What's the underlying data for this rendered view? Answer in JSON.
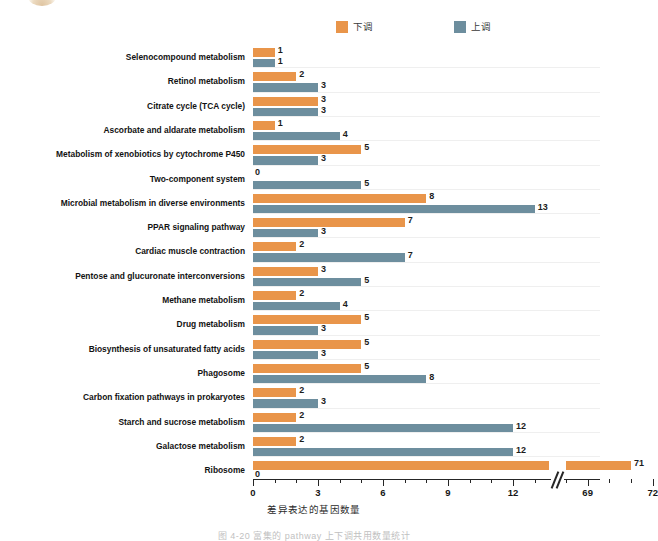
{
  "legend": {
    "entries": [
      {
        "label": "下调",
        "color": "#e9954a",
        "name": "down-regulated"
      },
      {
        "label": "上调",
        "color": "#6d8e9e",
        "name": "up-regulated"
      }
    ]
  },
  "axis": {
    "x_title": "差异表达的基因数量",
    "tick_labels": [
      "0",
      "3",
      "6",
      "9",
      "12",
      "69",
      "72"
    ],
    "has_break": true,
    "break_between": [
      12,
      69
    ]
  },
  "caption": {
    "text": "图 4-20  富集的 pathway 上下调共用数量统计"
  },
  "chart_data": {
    "type": "bar",
    "orientation": "horizontal",
    "title": "",
    "xlabel": "差异表达的基因数量",
    "ylabel": "",
    "xlim": [
      0,
      72
    ],
    "grid": false,
    "legend_position": "top-center",
    "axis_break": {
      "from": 13,
      "to": 68
    },
    "categories": [
      "Selenocompound metabolism",
      "Retinol metabolism",
      "Citrate cycle (TCA cycle)",
      "Ascorbate and aldarate metabolism",
      "Metabolism of xenobiotics by cytochrome P450",
      "Two-component system",
      "Microbial metabolism in diverse environments",
      "PPAR signaling pathway",
      "Cardiac muscle contraction",
      "Pentose and glucuronate interconversions",
      "Methane metabolism",
      "Drug metabolism",
      "Biosynthesis of unsaturated fatty acids",
      "Phagosome",
      "Carbon fixation pathways in prokaryotes",
      "Starch and sucrose metabolism",
      "Galactose metabolism",
      "Ribosome"
    ],
    "series": [
      {
        "name": "下调",
        "color": "#e9954a",
        "values": [
          1,
          2,
          3,
          1,
          5,
          0,
          8,
          7,
          2,
          3,
          2,
          5,
          5,
          5,
          2,
          2,
          2,
          71
        ]
      },
      {
        "name": "上调",
        "color": "#6d8e9e",
        "values": [
          1,
          3,
          3,
          4,
          3,
          5,
          13,
          3,
          7,
          5,
          4,
          3,
          3,
          8,
          3,
          12,
          12,
          0
        ]
      }
    ]
  }
}
